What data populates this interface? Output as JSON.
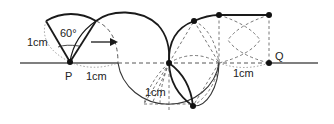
{
  "diagram": {
    "labels": {
      "point_p": "P",
      "point_q": "Q",
      "angle": "60°",
      "radius_left": "1cm",
      "radius_bottom_p": "1cm",
      "radius_lower_middle": "1cm",
      "radius_right": "1cm"
    },
    "colors": {
      "stroke": "#1a1a1a",
      "dashed": "#555555",
      "baseline": "#777777"
    }
  }
}
